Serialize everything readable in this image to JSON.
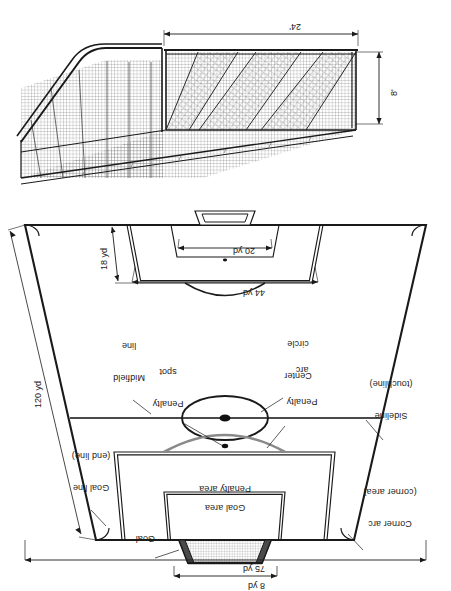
{
  "figure": {
    "title_none": "",
    "orientation_note": "rotated-180",
    "ink_color": "#1a1a1a",
    "line_color": "#333333",
    "net_color": "#555555",
    "fill_color": "#ffffff"
  },
  "goal_detail": {
    "name": "soccer-goal-perspective",
    "dimensions": [
      {
        "id": "goal-height",
        "label": "8'",
        "axis": "vertical",
        "value": 8,
        "unit": "ft"
      },
      {
        "id": "goal-width",
        "label": "24'",
        "axis": "horizontal",
        "value": 24,
        "unit": "ft"
      }
    ]
  },
  "field_plan": {
    "name": "soccer-field-plan",
    "dimensions": [
      {
        "id": "field-width",
        "label": "75 yd",
        "value": 75,
        "unit": "yd"
      },
      {
        "id": "field-length",
        "label": "120 yd",
        "value": 120,
        "unit": "yd"
      },
      {
        "id": "goal-area-width",
        "label": "8 yd",
        "value": 8,
        "unit": "yd"
      },
      {
        "id": "penalty-area-width",
        "label": "44 yd",
        "value": 44,
        "unit": "yd"
      },
      {
        "id": "penalty-area-depth",
        "label": "18 yd",
        "value": 18,
        "unit": "yd"
      },
      {
        "id": "goal-area-depth",
        "label": "20 yd",
        "value": 20,
        "unit": "yd"
      }
    ],
    "callouts": [
      {
        "id": "corner-arc",
        "line1": "Corner arc",
        "line2": "(corner area)"
      },
      {
        "id": "goal",
        "line1": "Goal",
        "line2": ""
      },
      {
        "id": "goal-area",
        "line1": "Goal area",
        "line2": ""
      },
      {
        "id": "penalty-area",
        "line1": "Penalty area",
        "line2": ""
      },
      {
        "id": "goal-line",
        "line1": "Goal line",
        "line2": "(end line)"
      },
      {
        "id": "penalty-arc",
        "line1": "Penalty",
        "line2": "arc"
      },
      {
        "id": "penalty-spot",
        "line1": "Penalty",
        "line2": "spot"
      },
      {
        "id": "sideline",
        "line1": "Sideline",
        "line2": "(touchline)"
      },
      {
        "id": "center-circle",
        "line1": "Center",
        "line2": "circle"
      },
      {
        "id": "midfield-line",
        "line1": "Midfield",
        "line2": "line"
      }
    ]
  }
}
